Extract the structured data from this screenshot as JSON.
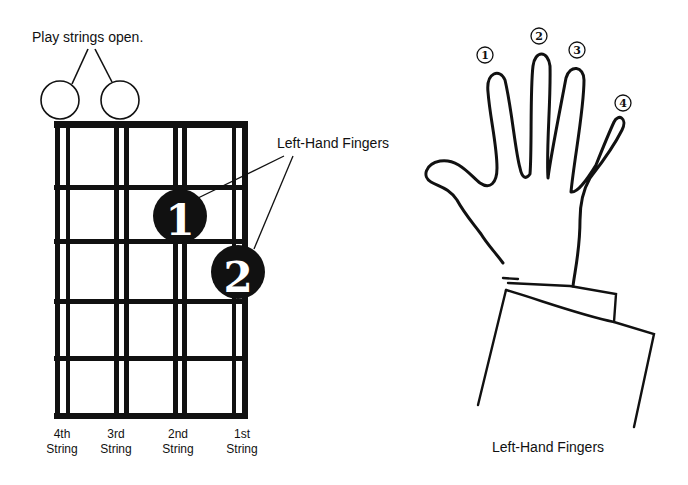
{
  "fretboard": {
    "open_label": "Play strings open.",
    "fingers_label": "Left-Hand Fingers",
    "finger_markers": [
      {
        "number": "1",
        "string": "2nd",
        "fret": 2
      },
      {
        "number": "2",
        "string": "1st",
        "fret": 3
      }
    ],
    "open_strings": [
      "4th",
      "3rd"
    ],
    "strings": [
      {
        "line1": "4th",
        "line2": "String"
      },
      {
        "line1": "3rd",
        "line2": "String"
      },
      {
        "line1": "2nd",
        "line2": "String"
      },
      {
        "line1": "1st",
        "line2": "String"
      }
    ]
  },
  "hand": {
    "caption": "Left-Hand Fingers",
    "finger_numbers": [
      "①",
      "②",
      "③",
      "④"
    ]
  },
  "colors": {
    "ink": "#111111",
    "paper": "#ffffff"
  }
}
